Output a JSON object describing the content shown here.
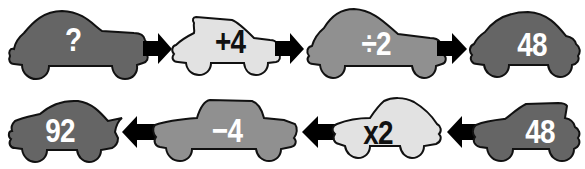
{
  "colors": {
    "dark_car": "#656565",
    "mid_car": "#909090",
    "light_car": "#e2e2e2",
    "outline": "#111111",
    "arrow": "#000000",
    "text_on_dark": "#ffffff",
    "text_on_light": "#111111"
  },
  "rows": [
    {
      "direction": "right",
      "cars": [
        {
          "label": "?",
          "shade": "dark"
        },
        {
          "label": "+4",
          "shade": "light"
        },
        {
          "label": "÷2",
          "shade": "mid"
        },
        {
          "label": "48",
          "shade": "dark"
        }
      ]
    },
    {
      "direction": "left",
      "cars": [
        {
          "label": "92",
          "shade": "dark"
        },
        {
          "label": "−4",
          "shade": "mid"
        },
        {
          "label": "x2",
          "shade": "light"
        },
        {
          "label": "48",
          "shade": "dark"
        }
      ]
    }
  ]
}
